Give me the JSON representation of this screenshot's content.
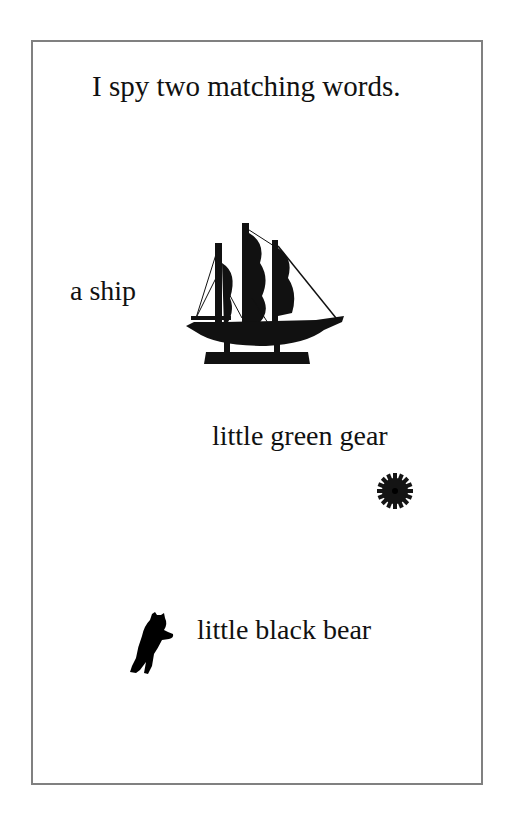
{
  "page": {
    "title": "I spy two matching words.",
    "items": [
      {
        "label": "a ship",
        "icon": "ship-icon"
      },
      {
        "label": "little green gear",
        "icon": "gear-icon"
      },
      {
        "label": "little black bear",
        "icon": "bear-icon"
      }
    ]
  },
  "colors": {
    "border": "#808080",
    "ink": "#111111",
    "background": "#ffffff"
  }
}
